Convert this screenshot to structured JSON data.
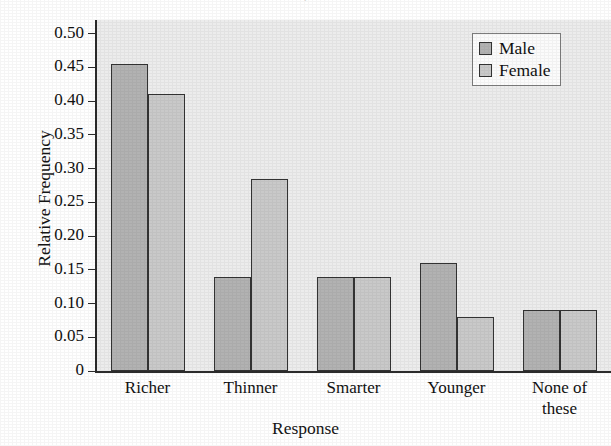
{
  "chart_data": {
    "type": "bar",
    "title": "",
    "xlabel": "Response",
    "ylabel": "Relative Frequency",
    "categories": [
      "Richer",
      "Thinner",
      "Smarter",
      "Younger",
      "None of these"
    ],
    "series": [
      {
        "name": "Male",
        "color": "#b2b2b2",
        "values": [
          0.455,
          0.14,
          0.14,
          0.16,
          0.09
        ]
      },
      {
        "name": "Female",
        "color": "#c9c9c9",
        "values": [
          0.41,
          0.285,
          0.14,
          0.08,
          0.09
        ]
      }
    ],
    "ylim": [
      0,
      0.52
    ],
    "yticks": [
      0,
      0.05,
      0.1,
      0.15,
      0.2,
      0.25,
      0.3,
      0.35,
      0.4,
      0.45,
      0.5
    ],
    "ytick_labels": [
      "0",
      "0.05",
      "0.10",
      "0.15",
      "0.20",
      "0.25",
      "0.30",
      "0.35",
      "0.40",
      "0.45",
      "0.50"
    ],
    "grid": false,
    "legend_position": "top-right",
    "plot_background": "#ececec"
  },
  "axes": {
    "y_title": "Relative Frequency",
    "x_title": "Response"
  },
  "legend": {
    "entries": [
      {
        "label": "Male",
        "swatch": "male-swatch"
      },
      {
        "label": "Female",
        "swatch": "female-swatch"
      }
    ]
  },
  "xlabels": [
    {
      "line1": "Richer",
      "line2": ""
    },
    {
      "line1": "Thinner",
      "line2": ""
    },
    {
      "line1": "Smarter",
      "line2": ""
    },
    {
      "line1": "Younger",
      "line2": ""
    },
    {
      "line1": "None of",
      "line2": "these"
    }
  ],
  "title_fragment": "•"
}
